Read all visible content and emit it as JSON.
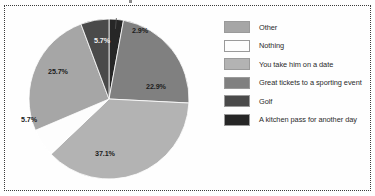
{
  "chart_data": {
    "type": "pie",
    "title": "",
    "legend_position": "right",
    "categories": [
      "Other",
      "Nothing",
      "You take him on a date",
      "Great tickets to a sporting event",
      "Golf",
      "A kitchen pass for another day"
    ],
    "values": [
      25.7,
      5.7,
      37.1,
      22.9,
      5.7,
      2.9
    ],
    "value_labels": [
      "25.7%",
      "5.7%",
      "37.1%",
      "22.9%",
      "5.7%",
      "2.9%"
    ],
    "colors": [
      "#a6a6a6",
      "#fdfdfd",
      "#b3b3b3",
      "#808080",
      "#4a4a4a",
      "#262626"
    ],
    "units": "percent",
    "total": 100.0,
    "slices_clockwise_from_top": [
      {
        "label": "A kitchen pass for another day",
        "value": 2.9,
        "value_label": "2.9%",
        "color": "#262626",
        "label_color": "dark",
        "leader_line": true
      },
      {
        "label": "Great tickets to a sporting event",
        "value": 22.9,
        "value_label": "22.9%",
        "color": "#808080",
        "label_color": "dark",
        "leader_line": false
      },
      {
        "label": "You take him on a date",
        "value": 37.1,
        "value_label": "37.1%",
        "color": "#b3b3b3",
        "label_color": "dark",
        "leader_line": false
      },
      {
        "label": "Nothing",
        "value": 5.7,
        "value_label": "5.7%",
        "color": "#fdfdfd",
        "label_color": "dark",
        "leader_line": false
      },
      {
        "label": "Other",
        "value": 25.7,
        "value_label": "25.7%",
        "color": "#a6a6a6",
        "label_color": "dark",
        "leader_line": false
      },
      {
        "label": "Golf",
        "value": 5.7,
        "value_label": "5.7%",
        "color": "#4a4a4a",
        "label_color": "light",
        "leader_line": false
      }
    ]
  },
  "legend": {
    "items": [
      {
        "label": "Other",
        "color": "#a6a6a6"
      },
      {
        "label": "Nothing",
        "color": "#fdfdfd"
      },
      {
        "label": "You take him on a date",
        "color": "#b3b3b3"
      },
      {
        "label": "Great tickets to a sporting event",
        "color": "#808080"
      },
      {
        "label": "Golf",
        "color": "#4a4a4a"
      },
      {
        "label": "A kitchen pass for another day",
        "color": "#262626"
      }
    ]
  },
  "style": {
    "background": "#fefefe",
    "border_color": "#3b3b3b",
    "slice_outline": "#ffffff"
  }
}
